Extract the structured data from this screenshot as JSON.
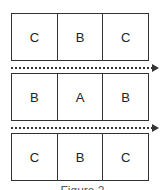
{
  "rows": [
    {
      "cells": [
        "C",
        "B",
        "C"
      ]
    },
    {
      "cells": [
        "B",
        "A",
        "B"
      ]
    },
    {
      "cells": [
        "C",
        "B",
        "C"
      ]
    }
  ],
  "arrows": [
    {
      "style": "dotted",
      "direction": "right"
    },
    {
      "style": "dotted",
      "direction": "right"
    }
  ],
  "caption": "Figure 2",
  "colors": {
    "stroke": "#333333",
    "text": "#222222"
  }
}
